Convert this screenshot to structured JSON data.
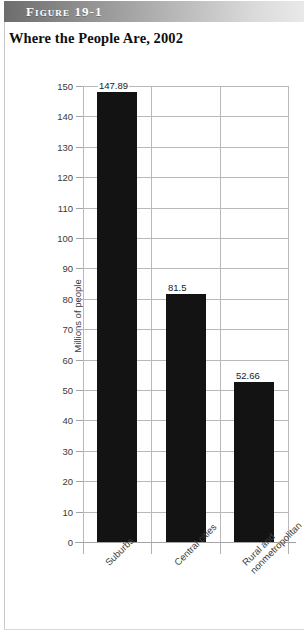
{
  "figure": {
    "number_label": "Figure 19-1",
    "title": "Where the People Are, 2002"
  },
  "chart_data": {
    "type": "bar",
    "title": "Where the People Are, 2002",
    "xlabel": "",
    "ylabel": "Millions of people",
    "categories": [
      "Suburbs",
      "Central cities",
      "Rural and\nnonmetropolitan"
    ],
    "category_lines": [
      [
        "Suburbs"
      ],
      [
        "Central cities"
      ],
      [
        "Rural and",
        "nonmetropolitan"
      ]
    ],
    "values": [
      147.89,
      81.5,
      52.66
    ],
    "value_labels": [
      "147.89",
      "81.5",
      "52.66"
    ],
    "ylim": [
      0,
      150
    ],
    "ytick_step": 10,
    "ytick_labels": [
      "0",
      "10",
      "20",
      "30",
      "40",
      "50",
      "60",
      "70",
      "80",
      "90",
      "100",
      "110",
      "120",
      "130",
      "140",
      "150"
    ],
    "grid": true,
    "legend": "none",
    "bar_color": "#131313",
    "grid_color": "#b9b9b9"
  }
}
